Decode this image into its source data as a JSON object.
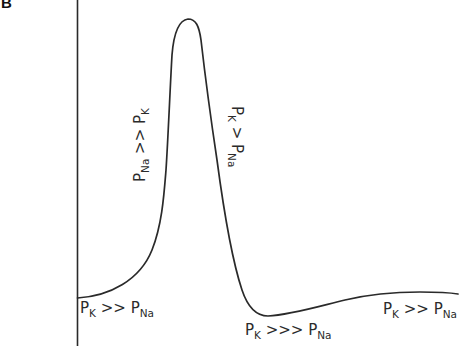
{
  "panel": {
    "letter": "B"
  },
  "figure": {
    "type": "action-potential-permeability-diagram",
    "axis": "vertical-membrane-potential-axis",
    "curve_color": "#2a2a2a"
  },
  "labels": {
    "rest_start": {
      "p1": "P",
      "s1": "K",
      "op": " >> ",
      "p2": "P",
      "s2": "Na"
    },
    "rising": {
      "p1": "P",
      "s1": "Na",
      "op": " >> ",
      "p2": "P",
      "s2": "K"
    },
    "falling": {
      "p1": "P",
      "s1": "K",
      "op": " > ",
      "p2": "P",
      "s2": "Na"
    },
    "undershoot": {
      "p1": "P",
      "s1": "K",
      "op": " >>> ",
      "p2": "P",
      "s2": "Na"
    },
    "rest_end": {
      "p1": "P",
      "s1": "K",
      "op": " >> ",
      "p2": "P",
      "s2": "Na"
    }
  }
}
